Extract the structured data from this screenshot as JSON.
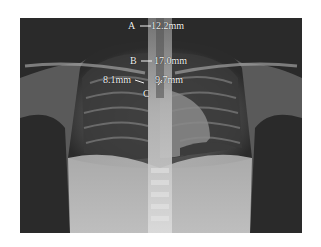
{
  "figure": {
    "labels": {
      "a_letter": "A",
      "a_value": "12.2mm",
      "b_letter": "B",
      "b_value": "17.0mm",
      "c_letter": "C",
      "c_left_value": "8.1mm",
      "c_right_value": "9.7mm"
    },
    "colors": {
      "background": "#ffffff",
      "film": "#2a2a2a",
      "annotation": "#f2f2f2"
    }
  }
}
